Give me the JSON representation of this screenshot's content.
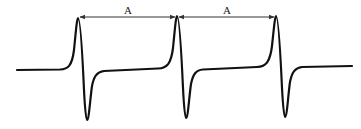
{
  "diagram": {
    "type": "periodic-waveform",
    "colors": {
      "line": "#111111",
      "arrow": "#333333",
      "background": "#ffffff"
    },
    "pulses": [
      {
        "peak_x": 78,
        "peak_y": 18,
        "trough_x": 87,
        "trough_y": 120
      },
      {
        "peak_x": 177,
        "peak_y": 16,
        "trough_x": 186,
        "trough_y": 118
      },
      {
        "peak_x": 276,
        "peak_y": 16,
        "trough_x": 285,
        "trough_y": 117
      }
    ],
    "intervals": [
      {
        "label": "A",
        "from": "pulse 1 peak",
        "to": "pulse 2 peak"
      },
      {
        "label": "A",
        "from": "pulse 2 peak",
        "to": "pulse 3 peak"
      }
    ]
  }
}
